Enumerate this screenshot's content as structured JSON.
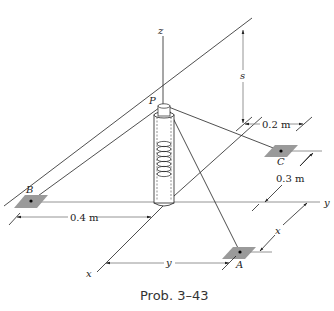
{
  "figure": {
    "caption": "Prob. 3–43",
    "axes": {
      "x": "x",
      "y": "y",
      "z": "z"
    },
    "points": {
      "P": "P",
      "A": "A",
      "B": "B",
      "C": "C"
    },
    "dimensions": {
      "s": "s",
      "d_0_2": "0.2 m",
      "d_0_3": "0.3 m",
      "d_0_4": "0.4 m",
      "x": "x",
      "y": "y"
    },
    "colors": {
      "line": "#222222",
      "plate": "#9a9a9a",
      "axis_gray": "#888888"
    }
  }
}
